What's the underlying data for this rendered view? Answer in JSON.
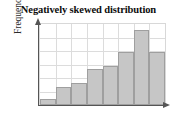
{
  "chart_data": {
    "type": "bar",
    "title": "Negatively skewed distribution",
    "xlabel": "",
    "ylabel": "Frequency",
    "categories": [
      "1",
      "2",
      "3",
      "4",
      "5",
      "6",
      "7",
      "8"
    ],
    "values": [
      8,
      22,
      27,
      44,
      48,
      65,
      92,
      65
    ],
    "ylim": [
      0,
      100
    ],
    "xlim": [
      0,
      8
    ],
    "grid": true,
    "legend": null,
    "bar_fill_color": "#c6c6c6",
    "bar_border_color": "#9f9f9f",
    "axis_color": "#555555",
    "grid_color": "#dcdcdc",
    "bars": [
      {
        "label": "1",
        "value": 8
      },
      {
        "label": "2",
        "value": 22
      },
      {
        "label": "3",
        "value": 27
      },
      {
        "label": "4",
        "value": 44
      },
      {
        "label": "5",
        "value": 48
      },
      {
        "label": "6",
        "value": 65
      },
      {
        "label": "7",
        "value": 92
      },
      {
        "label": "8",
        "value": 65
      }
    ],
    "gridlines_horizontal": 5,
    "gridlines_vertical": 7
  }
}
